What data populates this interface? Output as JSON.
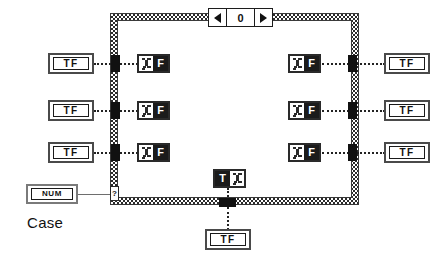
{
  "diagram": {
    "caption": "Case",
    "structure": {
      "name": "case-structure",
      "selector": {
        "value": "0",
        "left_arrow": "◀",
        "right_arrow": "▶"
      }
    }
  },
  "terminals": {
    "boolean_label": "TF",
    "numeric_label": "NUM",
    "case_selector_label": "?"
  },
  "left_inputs": [
    {
      "label": "TF"
    },
    {
      "label": "TF"
    },
    {
      "label": "TF"
    }
  ],
  "right_outputs": [
    {
      "label": "TF"
    },
    {
      "label": "TF"
    },
    {
      "label": "TF"
    }
  ],
  "bottom_output": {
    "label": "TF"
  },
  "numeric_control": {
    "label": "NUM"
  },
  "local_variables_left": [
    {
      "letter": "F",
      "icon": "local-variable-icon"
    },
    {
      "letter": "F",
      "icon": "local-variable-icon"
    },
    {
      "letter": "F",
      "icon": "local-variable-icon"
    }
  ],
  "local_variables_right": [
    {
      "letter": "F",
      "icon": "local-variable-icon"
    },
    {
      "letter": "F",
      "icon": "local-variable-icon"
    },
    {
      "letter": "F",
      "icon": "local-variable-icon"
    }
  ],
  "local_variable_bottom": {
    "letter": "T",
    "icon": "local-variable-icon"
  },
  "colors": {
    "wire": "#222222",
    "border": "#2b2b2b",
    "tunnel": "#111111",
    "node_fill": "#1b1b1b",
    "background": "#ffffff"
  }
}
